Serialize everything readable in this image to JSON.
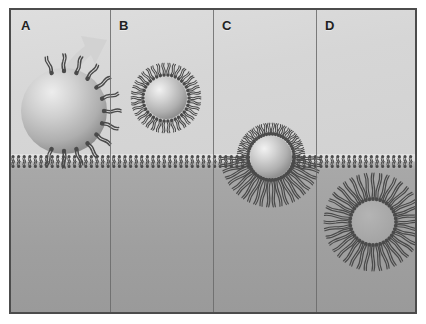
{
  "figure": {
    "background_upper_color": "#d9d9d9",
    "background_lower_color": "#a0a0a0",
    "border_color": "#4c4c4c",
    "lipid_color": "#4a4a4a",
    "sphere_color": "#b4b4b4",
    "arrow_color": "#cfcfcf",
    "panel_count": 4
  },
  "panels": [
    {
      "id": "A",
      "label": "A",
      "caption": "Lipid-decorated nanoparticle approaching the membrane",
      "particle": {
        "present": true,
        "radius": 46,
        "cx": 53,
        "cy": 100
      },
      "lipid_arrangement": "sparse-radial-on-sphere",
      "lipid_count": 12,
      "arrow": {
        "present": true,
        "direction": "up-right",
        "meaning": "particle motion"
      },
      "membrane_state": "intact"
    },
    {
      "id": "B",
      "label": "B",
      "caption": "Nanoparticle fully enveloped by a lipid corona",
      "particle": {
        "present": true,
        "radius": 22,
        "cx": 51,
        "cy": 88
      },
      "lipid_arrangement": "dense-radial-shell",
      "lipid_count": 40,
      "arrow": {
        "present": false
      },
      "membrane_state": "intact"
    },
    {
      "id": "C",
      "label": "C",
      "caption": "Coated nanoparticle translocating across the bilayer",
      "particle": {
        "present": true,
        "radius": 22,
        "cx": 52,
        "cy": 147
      },
      "lipid_arrangement": "dense-shell-with-splayed-tails-below",
      "lipid_count": 44,
      "arrow": {
        "present": false
      },
      "membrane_state": "engaged"
    },
    {
      "id": "D",
      "label": "D",
      "caption": "Lipid-lined vesicular void remaining after particle passage",
      "particle": {
        "present": false,
        "radius": 22,
        "cx": 52,
        "cy": 212
      },
      "lipid_arrangement": "hollow-radial-vesicle",
      "lipid_count": 44,
      "arrow": {
        "present": false
      },
      "membrane_state": "resealed"
    }
  ],
  "membrane": {
    "name": "lipid bilayer",
    "y_position": 151,
    "leaflets": 2,
    "head_shape": "circle",
    "tail_count_per_lipid": 2
  }
}
